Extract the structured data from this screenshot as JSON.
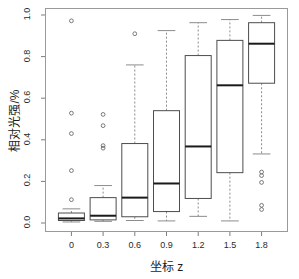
{
  "chart_data": {
    "type": "box",
    "title": "",
    "subtitle": "",
    "xlabel": "坐标 z",
    "ylabel": "相对光强/%",
    "grid": false,
    "legend": "none",
    "xlim": [
      -0.25,
      2.05
    ],
    "ylim": [
      0.0,
      1.0
    ],
    "ytick_values": [
      0.0,
      0.2,
      0.4,
      0.6,
      0.8,
      1.0
    ],
    "ytick_labels": [
      "0.0",
      "0.2",
      "0.4",
      "0.6",
      "0.8",
      "1.0"
    ],
    "xtick_values": [
      0,
      0.3,
      0.6,
      0.9,
      1.2,
      1.5,
      1.8
    ],
    "xtick_labels": [
      "0",
      "0.3",
      "0.6",
      "0.9",
      "1.2",
      "1.5",
      "1.8"
    ],
    "box_color": "#ffffff",
    "box_edge_color": "#4d4d4d",
    "median_color": "#1a1a1a",
    "whisker_color": "#8c8c8c",
    "outlier_color": "#6b6b6b",
    "boxes": [
      {
        "x": 0,
        "label": "0",
        "whisker_low": 0.005,
        "q1": 0.012,
        "median": 0.022,
        "q3": 0.048,
        "whisker_high": 0.068,
        "outliers": [
          0.972,
          0.528,
          0.43,
          0.252,
          0.112
        ]
      },
      {
        "x": 0.3,
        "label": "0.3",
        "whisker_low": 0.008,
        "q1": 0.015,
        "median": 0.035,
        "q3": 0.122,
        "whisker_high": 0.18,
        "outliers": [
          0.522,
          0.468,
          0.372,
          0.36
        ]
      },
      {
        "x": 0.6,
        "label": "0.6",
        "whisker_low": 0.012,
        "q1": 0.03,
        "median": 0.122,
        "q3": 0.382,
        "whisker_high": 0.76,
        "outliers": [
          0.91
        ]
      },
      {
        "x": 0.9,
        "label": "0.9",
        "whisker_low": 0.01,
        "q1": 0.055,
        "median": 0.19,
        "q3": 0.54,
        "whisker_high": 0.925,
        "outliers": []
      },
      {
        "x": 1.2,
        "label": "1.2",
        "whisker_low": 0.032,
        "q1": 0.118,
        "median": 0.368,
        "q3": 0.805,
        "whisker_high": 0.963,
        "outliers": []
      },
      {
        "x": 1.5,
        "label": "1.5",
        "whisker_low": 0.01,
        "q1": 0.242,
        "median": 0.662,
        "q3": 0.878,
        "whisker_high": 0.978,
        "outliers": []
      },
      {
        "x": 1.8,
        "label": "1.8",
        "whisker_low": 0.332,
        "q1": 0.672,
        "median": 0.862,
        "q3": 0.963,
        "whisker_high": 0.998,
        "outliers": [
          0.245,
          0.228,
          0.195,
          0.085,
          0.065
        ]
      }
    ]
  }
}
